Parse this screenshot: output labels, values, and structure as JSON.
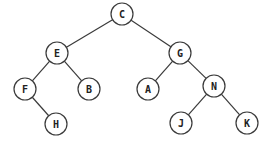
{
  "diagram": {
    "type": "binary-tree",
    "node_radius": 11,
    "stroke_color": "#3a3a3a",
    "nodes": [
      {
        "id": "C",
        "label": "C",
        "x": 122,
        "y": 14
      },
      {
        "id": "E",
        "label": "E",
        "x": 57,
        "y": 53
      },
      {
        "id": "G",
        "label": "G",
        "x": 180,
        "y": 53
      },
      {
        "id": "F",
        "label": "F",
        "x": 25,
        "y": 89
      },
      {
        "id": "B",
        "label": "B",
        "x": 89,
        "y": 89
      },
      {
        "id": "A",
        "label": "A",
        "x": 148,
        "y": 89
      },
      {
        "id": "N",
        "label": "N",
        "x": 214,
        "y": 86
      },
      {
        "id": "H",
        "label": "H",
        "x": 56,
        "y": 124
      },
      {
        "id": "J",
        "label": "J",
        "x": 181,
        "y": 123
      },
      {
        "id": "K",
        "label": "K",
        "x": 247,
        "y": 123
      }
    ],
    "edges": [
      {
        "from": "C",
        "to": "E"
      },
      {
        "from": "C",
        "to": "G"
      },
      {
        "from": "E",
        "to": "F"
      },
      {
        "from": "E",
        "to": "B"
      },
      {
        "from": "G",
        "to": "A"
      },
      {
        "from": "G",
        "to": "N"
      },
      {
        "from": "F",
        "to": "H"
      },
      {
        "from": "N",
        "to": "J"
      },
      {
        "from": "N",
        "to": "K"
      }
    ]
  }
}
